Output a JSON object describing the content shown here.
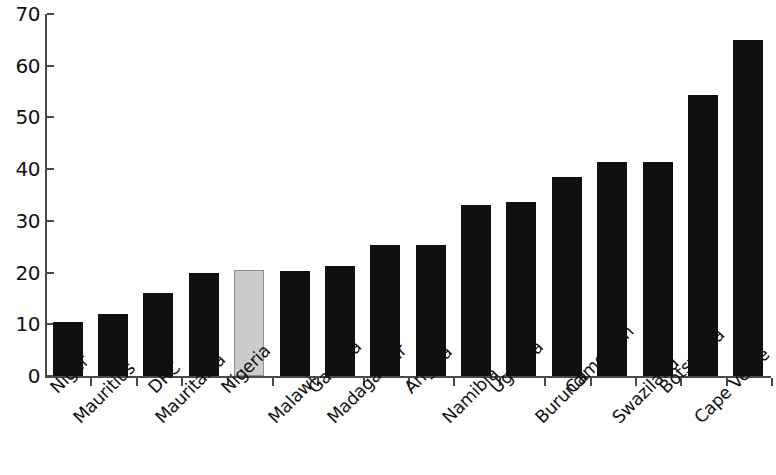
{
  "chart_data": {
    "type": "bar",
    "title": "",
    "subtitle": "",
    "xlabel": "",
    "ylabel": "",
    "ylim": [
      0,
      70
    ],
    "y_ticks": [
      0,
      10,
      20,
      30,
      40,
      50,
      60,
      70
    ],
    "grid": false,
    "legend": null,
    "categories": [
      "Niger",
      "Mauritius",
      "DRC",
      "Mauritania",
      "Nigeria",
      "Malawi",
      "Gambia",
      "Madagascar",
      "Angola",
      "Namibia",
      "Uganda",
      "Burundi",
      "Cameroon",
      "Swaziland",
      "Botswana",
      "Cape Verde"
    ],
    "values": [
      10.4,
      12.0,
      16.1,
      19.9,
      20.5,
      20.4,
      21.3,
      25.4,
      25.4,
      33.1,
      33.7,
      38.4,
      41.3,
      41.3,
      54.3,
      64.9
    ],
    "highlight_index": 4,
    "colors": {
      "bar": "#101010",
      "bar_highlight": "#cccccc",
      "bar_highlight_border": "#8f8f8f",
      "axis": "#4a4a4a",
      "text": "#111111",
      "background": "#ffffff"
    }
  }
}
